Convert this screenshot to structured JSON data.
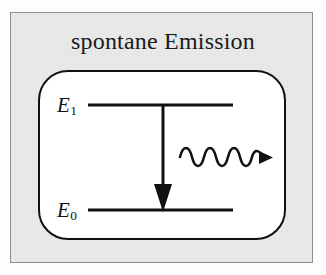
{
  "figure": {
    "title": "spontane Emission",
    "kind": "energy-level-diagram",
    "colors": {
      "ink": "#111111",
      "panel_background": "#e9e9e9",
      "box_background": "#ffffff",
      "panel_border": "#8e8e8e"
    }
  },
  "levels": [
    {
      "id": "upper",
      "symbol": "E",
      "subscript": "1",
      "label": "E1",
      "line_y": 105,
      "line_x_start": 88,
      "line_x_end": 233
    },
    {
      "id": "lower",
      "symbol": "E",
      "subscript": "0",
      "label": "E0",
      "line_y": 210,
      "line_x_start": 88,
      "line_x_end": 233
    }
  ],
  "transition_arrow": {
    "name": "downward-transition-arrow",
    "from_level": "upper",
    "to_level": "lower",
    "direction": "down",
    "x": 163,
    "y_start": 105,
    "y_end": 210
  },
  "photon_arrow": {
    "name": "emitted-photon-wavy-arrow",
    "direction": "right",
    "cycles": 4.5,
    "amplitude": 8,
    "x_start": 180,
    "x_end": 272,
    "y": 157
  }
}
